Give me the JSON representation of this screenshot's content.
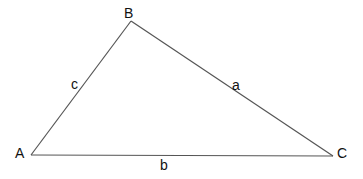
{
  "diagram": {
    "type": "triangle",
    "vertices": [
      {
        "id": "A",
        "label": "A",
        "x": 31,
        "y": 155,
        "label_x": 15,
        "label_y": 158
      },
      {
        "id": "B",
        "label": "B",
        "x": 131,
        "y": 21,
        "label_x": 124,
        "label_y": 18
      },
      {
        "id": "C",
        "label": "C",
        "x": 333,
        "y": 156,
        "label_x": 337,
        "label_y": 158
      }
    ],
    "sides": [
      {
        "id": "a",
        "label": "a",
        "from": "B",
        "to": "C",
        "label_x": 232,
        "label_y": 90
      },
      {
        "id": "b",
        "label": "b",
        "from": "A",
        "to": "C",
        "label_x": 160,
        "label_y": 170
      },
      {
        "id": "c",
        "label": "c",
        "from": "A",
        "to": "B",
        "label_x": 71,
        "label_y": 89
      }
    ],
    "line_color": "#555555",
    "text_color": "#111111"
  }
}
